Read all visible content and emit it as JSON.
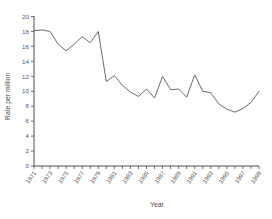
{
  "chart_data": {
    "type": "line",
    "title": "",
    "xlabel": "Year",
    "ylabel": "Rate per million",
    "xlim": [
      1971,
      1999
    ],
    "ylim": [
      0,
      20
    ],
    "yticks": [
      0,
      2,
      4,
      6,
      8,
      10,
      12,
      14,
      16,
      18,
      20
    ],
    "xticks": [
      1971,
      1973,
      1975,
      1977,
      1979,
      1981,
      1983,
      1985,
      1987,
      1989,
      1991,
      1993,
      1995,
      1997,
      1999
    ],
    "grid": false,
    "legend": null,
    "x": [
      1971,
      1972,
      1973,
      1974,
      1975,
      1976,
      1977,
      1978,
      1979,
      1980,
      1981,
      1982,
      1983,
      1984,
      1985,
      1986,
      1987,
      1988,
      1989,
      1990,
      1991,
      1992,
      1993,
      1994,
      1995,
      1996,
      1997,
      1998,
      1999
    ],
    "values": [
      18.1,
      18.2,
      18.0,
      16.3,
      15.4,
      16.3,
      17.3,
      16.5,
      18.0,
      11.3,
      12.1,
      10.8,
      9.9,
      9.3,
      10.3,
      9.1,
      12.0,
      10.2,
      10.3,
      9.2,
      12.2,
      10.0,
      9.8,
      8.3,
      7.6,
      7.2,
      7.7,
      8.5,
      10.0
    ],
    "series_name": "Rate per million"
  },
  "chart_meta": {
    "y_axis_title": "Rate per million",
    "x_axis_title": "Year"
  }
}
